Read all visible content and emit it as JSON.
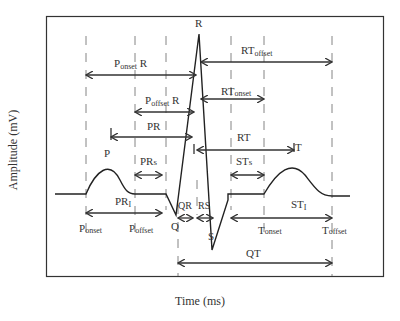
{
  "figure": {
    "x_axis_label": "Time (ms)",
    "y_axis_label": "Amplitude (mV)"
  },
  "waves": {
    "P": "P",
    "Q": "Q",
    "R": "R",
    "S": "S",
    "T": "T"
  },
  "intervals": [
    {
      "id": "ponset_r",
      "label": "P",
      "sub": "onset",
      "suffix": " R"
    },
    {
      "id": "poffset_r",
      "label": "P",
      "sub": "offset",
      "suffix": " R"
    },
    {
      "id": "pr",
      "label": "PR",
      "sub": "",
      "suffix": ""
    },
    {
      "id": "prs",
      "label": "PR",
      "sub": "s",
      "suffix": ""
    },
    {
      "id": "pri",
      "label": "PR",
      "sub": "I",
      "suffix": ""
    },
    {
      "id": "qr",
      "label": "QR",
      "sub": "",
      "suffix": ""
    },
    {
      "id": "rs",
      "label": "RS",
      "sub": "",
      "suffix": ""
    },
    {
      "id": "rtoffset",
      "label": "RT",
      "sub": "offset",
      "suffix": ""
    },
    {
      "id": "rtonset",
      "label": "RT",
      "sub": "onset",
      "suffix": ""
    },
    {
      "id": "rt",
      "label": "RT",
      "sub": "",
      "suffix": ""
    },
    {
      "id": "sts",
      "label": "ST",
      "sub": "s",
      "suffix": ""
    },
    {
      "id": "sti",
      "label": "ST",
      "sub": "I",
      "suffix": ""
    },
    {
      "id": "qt",
      "label": "QT",
      "sub": "",
      "suffix": ""
    }
  ],
  "markers": {
    "ponset": {
      "label": "P",
      "sub": "onset"
    },
    "poffset": {
      "label": "P",
      "sub": "offset"
    },
    "tonset": {
      "label": "T",
      "sub": "onset"
    },
    "toffset": {
      "label": "T",
      "sub": "offset"
    }
  }
}
